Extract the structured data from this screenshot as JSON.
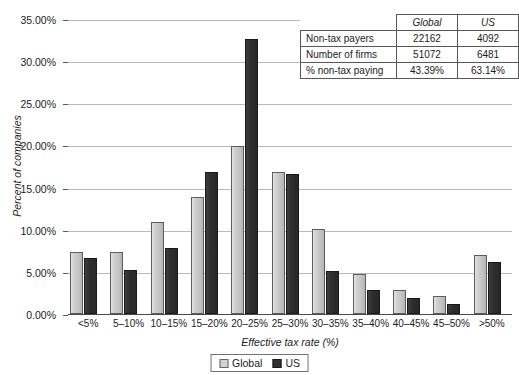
{
  "chart_data": {
    "type": "bar",
    "title": "",
    "xlabel": "Effective tax rate (%)",
    "ylabel": "Percent of companies",
    "ylim": [
      0,
      35
    ],
    "ytick_labels": [
      "0.00%",
      "5.00%",
      "10.00%",
      "15.00%",
      "20.00%",
      "25.00%",
      "30.00%",
      "35.00%"
    ],
    "ytick_values": [
      0,
      5,
      10,
      15,
      20,
      25,
      30,
      35
    ],
    "grid": true,
    "legend_position": "bottom-center",
    "categories": [
      "<5%",
      "5–10%",
      "10–15%",
      "15–20%",
      "20–25%",
      "25–30%",
      "30–35%",
      "35–40%",
      "40–45%",
      "45–50%",
      ">50%"
    ],
    "series": [
      {
        "name": "Global",
        "color": "#c9c9c9",
        "values": [
          7.3,
          7.4,
          10.9,
          13.9,
          19.9,
          16.9,
          10.1,
          4.7,
          2.8,
          2.1,
          7.0
        ]
      },
      {
        "name": "US",
        "color": "#2f2f2f",
        "values": [
          6.6,
          5.2,
          7.8,
          16.8,
          32.6,
          16.6,
          5.1,
          2.8,
          1.9,
          1.2,
          6.2
        ]
      }
    ]
  },
  "summary_table": {
    "corner_label": "",
    "columns": [
      "Global",
      "US"
    ],
    "rows": [
      {
        "label": "Non-tax payers",
        "global": "22162",
        "us": "4092"
      },
      {
        "label": "Number of firms",
        "global": "51072",
        "us": "6481"
      },
      {
        "label": "% non-tax paying",
        "global": "43.39%",
        "us": "63.14%"
      }
    ]
  },
  "legend": {
    "items": [
      {
        "label": "Global",
        "swatch": "global"
      },
      {
        "label": "US",
        "swatch": "us"
      }
    ]
  }
}
